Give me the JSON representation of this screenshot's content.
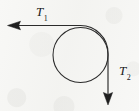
{
  "figure": {
    "type": "physics-force-diagram",
    "background_color": "#f8f8f6",
    "stroke_color": "#262626",
    "labels": {
      "t1": {
        "symbol": "T",
        "subscript": "1",
        "x": 36,
        "y": 5
      },
      "t2": {
        "symbol": "T",
        "subscript": "2",
        "x": 119,
        "y": 64
      }
    },
    "circle": {
      "name": "pulley-circle",
      "center_x": 80.5,
      "center_y": 55,
      "radius": 27.5,
      "fill": "none",
      "stroke_width": 1
    },
    "arrows": [
      {
        "name": "tension-arrow-t1",
        "direction": "left",
        "from_x": 108,
        "from_y": 25.5,
        "to_x": 8,
        "to_y": 25.5,
        "label": "T1"
      },
      {
        "name": "tension-arrow-t2",
        "direction": "down",
        "from_x": 110,
        "from_y": 55,
        "to_x": 110,
        "to_y": 104,
        "label": "T2"
      }
    ]
  }
}
